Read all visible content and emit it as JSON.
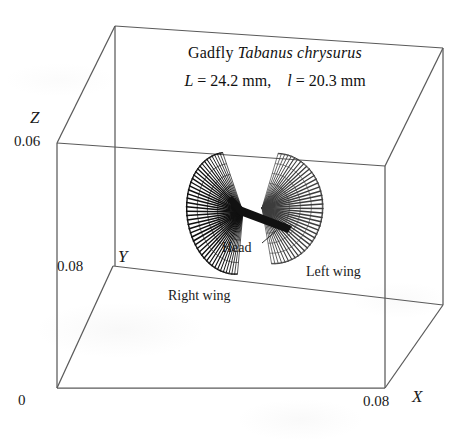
{
  "figure": {
    "title_common": "Gadfly",
    "title_species": "Tabanus chrysurus",
    "measure_L_symbol": "L",
    "measure_L_text": "= 24.2 mm,",
    "measure_l_symbol": "l",
    "measure_l_text": "= 20.3 mm"
  },
  "axes": {
    "x_name": "X",
    "y_name": "Y",
    "z_name": "Z",
    "origin_label": "0",
    "x_max_label": "0.08",
    "y_max_label": "0.08",
    "z_max_label": "0.06"
  },
  "annotations": {
    "head": "Head",
    "right_wing": "Right wing",
    "left_wing": "Left wing"
  },
  "colors": {
    "ink": "#1a1a1a",
    "frame": "#5a5a5a",
    "wing_dark": "#111111",
    "wing_light": "#4a4a4a",
    "paper": "#ffffff"
  },
  "chart_data": {
    "type": "line",
    "xlabel": "X",
    "ylabel": "Y",
    "zlabel": "Z",
    "xlim": [
      0,
      0.08
    ],
    "ylim": [
      0,
      0.08
    ],
    "zlim": [
      0,
      0.06
    ],
    "grid": false,
    "legend": "none",
    "units": "m",
    "body_length_L_mm": 24.2,
    "wing_length_l_mm": 20.3,
    "series": [
      {
        "name": "Right wing",
        "style": "dense radial fan, dark",
        "pivot_px": [
          243,
          212
        ],
        "stroke_count": 46,
        "angle_start_deg": 108,
        "angle_end_deg": 255,
        "radius_px": 78
      },
      {
        "name": "Left wing",
        "style": "radial fan, lighter",
        "pivot_px": [
          262,
          208
        ],
        "stroke_count": 42,
        "angle_start_deg": -78,
        "angle_end_deg": 72,
        "radius_px": 76
      },
      {
        "name": "Body axis",
        "style": "solid dark bar",
        "from_px": [
          243,
          213
        ],
        "to_px": [
          288,
          228
        ]
      }
    ]
  }
}
